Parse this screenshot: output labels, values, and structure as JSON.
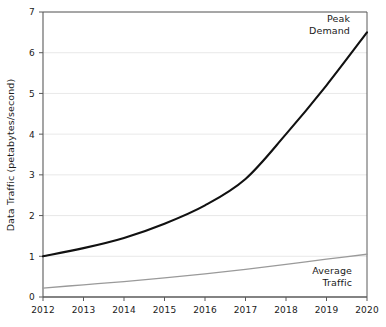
{
  "chart_data": {
    "type": "line",
    "title": "",
    "xlabel": "",
    "ylabel": "Data Traffic (petabytes/second)",
    "x": [
      2012,
      2013,
      2014,
      2015,
      2016,
      2017,
      2018,
      2019,
      2020
    ],
    "categories": [
      "2012",
      "2013",
      "2014",
      "2015",
      "2016",
      "2017",
      "2018",
      "2019",
      "2020"
    ],
    "xlim": [
      2012,
      2020
    ],
    "ylim": [
      0,
      7
    ],
    "y_ticks": [
      0,
      1,
      2,
      3,
      4,
      5,
      6,
      7
    ],
    "y_tick_labels": [
      "0",
      "1",
      "2",
      "3",
      "4",
      "5",
      "6",
      "7"
    ],
    "grid": true,
    "grid_axis": "y",
    "legend": "inline-annotations",
    "series": [
      {
        "name": "Peak Demand",
        "color": "#111111",
        "values": [
          1.0,
          1.2,
          1.45,
          1.8,
          2.25,
          2.9,
          4.0,
          5.2,
          6.5
        ]
      },
      {
        "name": "Average Traffic",
        "color": "#9a9a9a",
        "values": [
          0.22,
          0.3,
          0.38,
          0.47,
          0.57,
          0.68,
          0.8,
          0.93,
          1.05
        ]
      }
    ],
    "annotations": [
      {
        "text_line1": "Peak",
        "text_line2": "Demand",
        "series": "Peak Demand"
      },
      {
        "text_line1": "Average",
        "text_line2": "Traffic",
        "series": "Average Traffic"
      }
    ]
  },
  "axes": {
    "y_title": "Data Traffic (petabytes/second)",
    "y_ticks": [
      "7",
      "6",
      "5",
      "4",
      "3",
      "2",
      "1",
      "0"
    ],
    "x_ticks": [
      "2012",
      "2013",
      "2014",
      "2015",
      "2016",
      "2017",
      "2018",
      "2019",
      "2020"
    ]
  },
  "labels": {
    "peak_line1": "Peak",
    "peak_line2": "Demand",
    "average_line1": "Average",
    "average_line2": "Traffic"
  },
  "colors": {
    "peak": "#111111",
    "average": "#9a9a9a",
    "grid": "#e2e2e2",
    "frame": "#5a5a5a",
    "text": "#1a1a1a",
    "background": "#ffffff"
  }
}
